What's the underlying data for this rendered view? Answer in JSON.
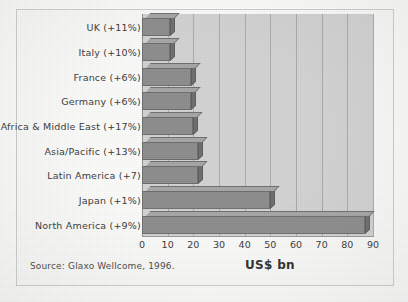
{
  "frame": {
    "border_color": "#cfcfcf"
  },
  "source_note": "Source: Glaxo Wellcome, 1996.",
  "colors": {
    "plot_background": "#d3d3d3",
    "bar_face": "#8d8d8d",
    "bar_top": "#a6a6a6",
    "bar_side": "#6f6f6f",
    "gridline": "#aaaaaa",
    "page_background": "#fdfdfc",
    "text": "#3a3a3a"
  },
  "chart_data": {
    "type": "bar",
    "orientation": "horizontal",
    "title": "",
    "subtitle": "",
    "xlabel": "US$ bn",
    "ylabel": "",
    "xlim": [
      0,
      90
    ],
    "xticks": [
      0,
      10,
      20,
      30,
      40,
      50,
      60,
      70,
      80,
      90
    ],
    "xtick_labels": [
      "0",
      "10",
      "20",
      "30",
      "40",
      "50",
      "60",
      "70",
      "80",
      "90"
    ],
    "grid": "vertical",
    "legend": "none",
    "categories": [
      "UK (+11%)",
      "Italy (+10%)",
      "France (+6%)",
      "Germany (+6%)",
      "Africa & Middle East (+17%)",
      "Asia/Pacific (+13%)",
      "Latin America (+7)",
      "Japan (+1%)",
      "North America (+9%)"
    ],
    "values": [
      11,
      11,
      19,
      19,
      20,
      22,
      22,
      50,
      87
    ],
    "annotation": "Source: Glaxo Wellcome, 1996."
  }
}
